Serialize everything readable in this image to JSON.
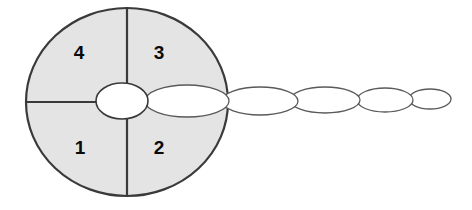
{
  "figure": {
    "background_color": "#ffffff",
    "width": 472,
    "height": 210
  },
  "colors": {
    "body_fill": "#e4e4e4",
    "body_stroke": "#3a3a3a",
    "tail_fill": "#ffffff",
    "tail_stroke": "#5a5a5a",
    "label_text": "#0a0a0a",
    "divider_stroke": "#3a3a3a"
  },
  "main_body": {
    "shape": "circle",
    "center_x": 127,
    "center_y": 102,
    "radius_x": 101,
    "radius_y": 94,
    "fill": "#e4e4e4",
    "stroke": "#3a3a3a",
    "stroke_width": 2.2
  },
  "dividers": {
    "vertical": {
      "x": 127,
      "y1": 8,
      "y2": 196
    },
    "horizontal_left": {
      "y": 102,
      "x1": 26,
      "x2": 99
    }
  },
  "quadrants": [
    {
      "id": "quadrant-4",
      "label": "4",
      "position": "upper-left",
      "cx": 79,
      "cy": 53
    },
    {
      "id": "quadrant-3",
      "label": "3",
      "position": "upper-right",
      "cx": 159,
      "cy": 53
    },
    {
      "id": "quadrant-1",
      "label": "1",
      "position": "lower-left",
      "cx": 80,
      "cy": 148
    },
    {
      "id": "quadrant-2",
      "label": "2",
      "position": "lower-right",
      "cx": 159,
      "cy": 148
    }
  ],
  "center_node": {
    "shape": "ellipse",
    "cx": 122,
    "cy": 101,
    "rx": 26,
    "ry": 18,
    "fill": "#ffffff",
    "stroke": "#3a3a3a",
    "stroke_width": 1.6
  },
  "tail_segments": [
    {
      "index": 1,
      "cx": 187,
      "cy": 101,
      "rx": 42,
      "ry": 16
    },
    {
      "index": 2,
      "cx": 260,
      "cy": 101,
      "rx": 38,
      "ry": 14
    },
    {
      "index": 3,
      "cx": 325,
      "cy": 100,
      "rx": 35,
      "ry": 13
    },
    {
      "index": 4,
      "cx": 385,
      "cy": 100,
      "rx": 28,
      "ry": 12
    },
    {
      "index": 5,
      "cx": 430,
      "cy": 99,
      "rx": 21,
      "ry": 10
    }
  ],
  "chart_data": {
    "type": "diagram",
    "labels": [
      "4",
      "3",
      "1",
      "2"
    ],
    "segment_count": 5,
    "segment_radii_x": [
      42,
      38,
      35,
      28,
      21
    ],
    "segment_radii_y": [
      16,
      14,
      13,
      12,
      10
    ]
  }
}
